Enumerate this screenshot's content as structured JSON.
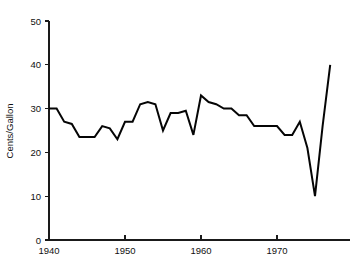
{
  "chart_data": {
    "type": "line",
    "title": "",
    "subtitle": "",
    "xlabel": "",
    "ylabel": "Cents/Gallon",
    "xlim": [
      1940,
      1977
    ],
    "ylim": [
      0,
      50
    ],
    "grid": false,
    "legend": false,
    "legend_position": "none",
    "x_ticks": [
      1940,
      1950,
      1960,
      1970
    ],
    "x_tick_labels": [
      "1940",
      "1950",
      "1960",
      "1970"
    ],
    "y_ticks": [
      0,
      10,
      20,
      30,
      40,
      50
    ],
    "y_tick_labels": [
      "0",
      "10",
      "20",
      "30",
      "40",
      "50"
    ],
    "series": [
      {
        "name": "Cents per Gallon",
        "color": "#050505",
        "x": [
          1940,
          1941,
          1942,
          1943,
          1944,
          1945,
          1946,
          1947,
          1948,
          1949,
          1950,
          1951,
          1952,
          1953,
          1954,
          1955,
          1956,
          1957,
          1958,
          1959,
          1960,
          1961,
          1962,
          1963,
          1964,
          1965,
          1966,
          1967,
          1968,
          1969,
          1970,
          1971,
          1972,
          1973,
          1974,
          1975,
          1976,
          1977
        ],
        "values": [
          30,
          30,
          27,
          26.5,
          23.5,
          23.5,
          23.5,
          26,
          25.5,
          23,
          27,
          27,
          31,
          31.5,
          31,
          25,
          29,
          29,
          29.5,
          24,
          33,
          31.5,
          31,
          30,
          30,
          28.5,
          28.5,
          26,
          26,
          26,
          26,
          24,
          24,
          27,
          21,
          10,
          26,
          40
        ]
      }
    ],
    "annotations": []
  },
  "axis": {
    "y_label": "Cents/Gallon"
  }
}
